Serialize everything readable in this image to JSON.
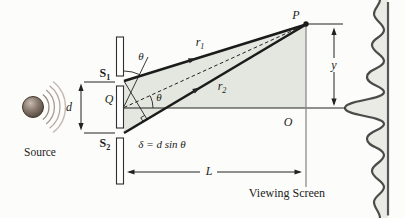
{
  "labels": {
    "source": "Source",
    "slit1": {
      "base": "S",
      "sub": "1"
    },
    "slit2": {
      "base": "S",
      "sub": "2"
    },
    "midpoint": "Q",
    "slit_separation": "d",
    "theta_top": "θ",
    "theta_mid": "θ",
    "ray1": {
      "base": "r",
      "sub": "1"
    },
    "ray2": {
      "base": "r",
      "sub": "2"
    },
    "point_p": "P",
    "distance_y": "y",
    "origin_o": "O",
    "distance_l": "L",
    "path_difference": "δ = d sin θ",
    "viewing_screen": "Viewing Screen"
  },
  "colors": {
    "background": "#fcfcfa",
    "shade": "#e4e7df",
    "band_shade": "#e9ebe4",
    "ink": "#222222",
    "ray": "#1b1b1b",
    "screen_line": "#8c8c8c",
    "intensity_line": "#565656",
    "curve": "#4b4b4b",
    "bar_fill": "#ffffff",
    "bar_stroke": "#2f2f2f",
    "sphere_hi": "#c9bcb2",
    "sphere_mid": "#8d7d72",
    "sphere_lo": "#55493f",
    "sphere_stroke": "#40362e",
    "text": "#1d1d1d"
  }
}
